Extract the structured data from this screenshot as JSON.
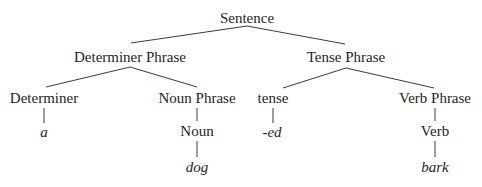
{
  "diagram": {
    "type": "syntax-tree",
    "nodes": {
      "sentence": {
        "label": "Sentence"
      },
      "determiner_phrase": {
        "label": "Determiner Phrase"
      },
      "tense_phrase": {
        "label": "Tense Phrase"
      },
      "determiner": {
        "label": "Determiner"
      },
      "noun_phrase": {
        "label": "Noun Phrase"
      },
      "tense": {
        "label": "tense"
      },
      "verb_phrase": {
        "label": "Verb Phrase"
      },
      "noun": {
        "label": "Noun"
      },
      "verb": {
        "label": "Verb"
      },
      "leaf_a": {
        "label": "a"
      },
      "leaf_dog": {
        "label": "dog"
      },
      "leaf_ed": {
        "label": "-ed"
      },
      "leaf_bark": {
        "label": "bark"
      }
    },
    "edges": [
      [
        "Sentence",
        "Determiner Phrase"
      ],
      [
        "Sentence",
        "Tense Phrase"
      ],
      [
        "Determiner Phrase",
        "Determiner"
      ],
      [
        "Determiner Phrase",
        "Noun Phrase"
      ],
      [
        "Tense Phrase",
        "tense"
      ],
      [
        "Tense Phrase",
        "Verb Phrase"
      ],
      [
        "Determiner",
        "a"
      ],
      [
        "Noun Phrase",
        "Noun"
      ],
      [
        "Noun",
        "dog"
      ],
      [
        "tense",
        "-ed"
      ],
      [
        "Verb Phrase",
        "Verb"
      ],
      [
        "Verb",
        "bark"
      ]
    ]
  }
}
